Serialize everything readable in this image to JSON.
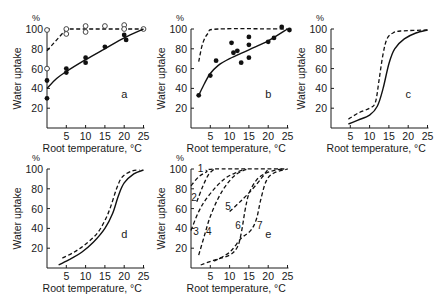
{
  "figure": {
    "y_axis_label": "Water uptake",
    "y_unit": "%",
    "x_axis_label": "Root temperature, °C",
    "x_ticks": [
      5,
      10,
      15,
      20,
      25
    ],
    "y_ticks": [
      20,
      40,
      60,
      80,
      100
    ]
  },
  "chart_data": [
    {
      "panel": "a",
      "type": "scatter",
      "xlabel": "Root temperature, °C",
      "ylabel": "Water uptake, %",
      "xlim": [
        0,
        25
      ],
      "ylim": [
        0,
        100
      ],
      "series": [
        {
          "name": "dashed (open circles)",
          "style": "dashed",
          "marker": "open",
          "line": [
            [
              0,
              78
            ],
            [
              5,
              100
            ],
            [
              25,
              100
            ]
          ],
          "points": [
            [
              0,
              99
            ],
            [
              0,
              60
            ],
            [
              5,
              100
            ],
            [
              5,
              95
            ],
            [
              10,
              103
            ],
            [
              10,
              97
            ],
            [
              15,
              103
            ],
            [
              20,
              104
            ],
            [
              20,
              100
            ],
            [
              25,
              100
            ]
          ]
        },
        {
          "name": "solid (filled circles)",
          "style": "solid",
          "marker": "filled",
          "line": [
            [
              0,
              40
            ],
            [
              2.5,
              50
            ],
            [
              5,
              57
            ],
            [
              10,
              69
            ],
            [
              15,
              80
            ],
            [
              20,
              91
            ],
            [
              25,
              100
            ]
          ],
          "points": [
            [
              0,
              48
            ],
            [
              0,
              30
            ],
            [
              5,
              60
            ],
            [
              5,
              56
            ],
            [
              10,
              71
            ],
            [
              10,
              66
            ],
            [
              15,
              82
            ],
            [
              20,
              94
            ],
            [
              20.5,
              89
            ]
          ]
        }
      ]
    },
    {
      "panel": "b",
      "type": "scatter",
      "xlabel": "Root temperature, °C",
      "ylabel": "Water uptake, %",
      "xlim": [
        0,
        25
      ],
      "ylim": [
        0,
        100
      ],
      "series": [
        {
          "name": "dashed",
          "style": "dashed",
          "marker": "none",
          "line": [
            [
              2,
              67
            ],
            [
              3,
              85
            ],
            [
              4.5,
              96
            ],
            [
              7,
              100
            ],
            [
              25,
              100
            ]
          ],
          "points": []
        },
        {
          "name": "solid (filled circles)",
          "style": "solid",
          "marker": "filled",
          "line": [
            [
              2,
              33
            ],
            [
              3.5,
              45
            ],
            [
              5,
              55
            ],
            [
              7,
              63
            ],
            [
              10,
              70
            ],
            [
              15,
              79
            ],
            [
              20,
              88
            ],
            [
              25,
              100
            ]
          ],
          "points": [
            [
              2,
              33
            ],
            [
              5,
              53
            ],
            [
              6.5,
              68
            ],
            [
              10.5,
              86
            ],
            [
              11,
              76
            ],
            [
              12,
              78
            ],
            [
              13,
              66
            ],
            [
              15,
              92
            ],
            [
              15,
              84
            ],
            [
              15,
              71
            ],
            [
              20,
              87
            ],
            [
              21.5,
              91
            ],
            [
              23.5,
              102
            ],
            [
              25.5,
              99
            ]
          ]
        }
      ]
    },
    {
      "panel": "c",
      "type": "line",
      "xlabel": "Root temperature, °C",
      "ylabel": "Water uptake, %",
      "xlim": [
        0,
        25
      ],
      "ylim": [
        0,
        100
      ],
      "series": [
        {
          "name": "dashed",
          "style": "dashed",
          "line": [
            [
              4.5,
              9
            ],
            [
              7,
              15
            ],
            [
              10,
              20
            ],
            [
              11.5,
              26
            ],
            [
              12.5,
              50
            ],
            [
              13.5,
              75
            ],
            [
              14.5,
              90
            ],
            [
              16,
              96
            ],
            [
              18,
              98
            ],
            [
              25,
              99
            ]
          ]
        },
        {
          "name": "solid",
          "style": "solid",
          "line": [
            [
              4.5,
              4
            ],
            [
              7,
              8
            ],
            [
              10,
              13
            ],
            [
              12,
              22
            ],
            [
              13.5,
              40
            ],
            [
              15,
              65
            ],
            [
              16.5,
              80
            ],
            [
              19,
              90
            ],
            [
              22,
              96
            ],
            [
              25,
              99
            ]
          ]
        }
      ]
    },
    {
      "panel": "d",
      "type": "line",
      "xlabel": "Root temperature, °C",
      "ylabel": "Water uptake, %",
      "xlim": [
        0,
        25
      ],
      "ylim": [
        0,
        100
      ],
      "series": [
        {
          "name": "dashed",
          "style": "dashed",
          "line": [
            [
              4,
              10
            ],
            [
              7,
              16
            ],
            [
              10,
              24
            ],
            [
              13,
              35
            ],
            [
              15,
              48
            ],
            [
              16.5,
              62
            ],
            [
              18,
              80
            ],
            [
              19.5,
              92
            ],
            [
              22,
              98
            ],
            [
              24,
              99
            ]
          ]
        },
        {
          "name": "solid",
          "style": "solid",
          "line": [
            [
              3,
              3
            ],
            [
              6,
              9
            ],
            [
              9,
              16
            ],
            [
              12,
              26
            ],
            [
              15,
              40
            ],
            [
              17,
              55
            ],
            [
              18.5,
              73
            ],
            [
              20,
              86
            ],
            [
              22.5,
              95
            ],
            [
              25,
              99
            ]
          ]
        }
      ]
    },
    {
      "panel": "e",
      "type": "line",
      "xlabel": "Root temperature, °C",
      "ylabel": "Water uptake, %",
      "xlim": [
        0,
        25
      ],
      "ylim": [
        0,
        100
      ],
      "series": [
        {
          "name": "1",
          "style": "dashed",
          "line": [
            [
              0,
              83
            ],
            [
              2,
              92
            ],
            [
              4,
              97
            ],
            [
              6,
              100
            ],
            [
              25,
              100
            ]
          ]
        },
        {
          "name": "2",
          "style": "dashed",
          "line": [
            [
              1.5,
              67
            ],
            [
              3,
              82
            ],
            [
              4.5,
              94
            ],
            [
              6,
              100
            ]
          ]
        },
        {
          "name": "3",
          "style": "dashed",
          "line": [
            [
              0,
              38
            ],
            [
              2,
              57
            ],
            [
              4,
              70
            ],
            [
              6.5,
              82
            ],
            [
              9,
              91
            ],
            [
              12,
              97
            ],
            [
              14,
              100
            ]
          ]
        },
        {
          "name": "4",
          "style": "dashed",
          "line": [
            [
              2,
              13
            ],
            [
              3.5,
              33
            ],
            [
              5,
              52
            ],
            [
              7,
              70
            ],
            [
              9,
              83
            ],
            [
              11.5,
              94
            ],
            [
              14.5,
              100
            ]
          ]
        },
        {
          "name": "5",
          "style": "dashed",
          "line": [
            [
              10,
              57
            ],
            [
              13,
              68
            ],
            [
              16,
              80
            ],
            [
              18.5,
              92
            ],
            [
              20,
              100
            ]
          ]
        },
        {
          "name": "6",
          "style": "dashed",
          "line": [
            [
              2.5,
              3
            ],
            [
              6,
              8
            ],
            [
              10,
              13
            ],
            [
              12,
              21
            ],
            [
              13,
              35
            ],
            [
              14,
              58
            ],
            [
              15,
              75
            ],
            [
              17,
              89
            ],
            [
              19.5,
              96
            ],
            [
              22,
              99
            ],
            [
              24,
              100
            ]
          ]
        },
        {
          "name": "7",
          "style": "dashed",
          "line": [
            [
              6,
              7
            ],
            [
              10,
              16
            ],
            [
              13,
              30
            ],
            [
              15.5,
              38
            ],
            [
              17,
              50
            ],
            [
              18,
              68
            ],
            [
              19.5,
              88
            ],
            [
              21.5,
              96
            ],
            [
              25,
              100
            ]
          ]
        }
      ]
    }
  ],
  "panels": {
    "a": {
      "letter": "a",
      "xlabel": "Root temperature, °C",
      "ylabel": "Water uptake",
      "unit": "%"
    },
    "b": {
      "letter": "b",
      "xlabel": "Root temperature, °C",
      "ylabel": "Water uptake",
      "unit": "%"
    },
    "c": {
      "letter": "c",
      "xlabel": "Root temperature, °C",
      "ylabel": "Water uptake",
      "unit": "%"
    },
    "d": {
      "letter": "d",
      "xlabel": "Root temperature, °C",
      "ylabel": "Water uptake",
      "unit": "%"
    },
    "e": {
      "letter": "e",
      "xlabel": "Root temperature, °C",
      "ylabel": "Water uptake",
      "unit": "%",
      "curve_labels": [
        {
          "text": "1",
          "x": 2.5,
          "y": 101
        },
        {
          "text": "2",
          "x": 0.8,
          "y": 72
        },
        {
          "text": "3",
          "x": 1.3,
          "y": 37
        },
        {
          "text": "4",
          "x": 4.6,
          "y": 37
        },
        {
          "text": "5",
          "x": 9.6,
          "y": 63
        },
        {
          "text": "6",
          "x": 12.2,
          "y": 43
        },
        {
          "text": "7",
          "x": 17.8,
          "y": 43
        }
      ]
    }
  }
}
